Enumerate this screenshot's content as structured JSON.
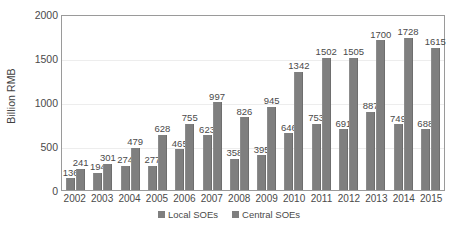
{
  "chart_data": {
    "type": "bar",
    "title": "",
    "subtitle": "",
    "xlabel": "",
    "ylabel": "Billion RMB",
    "ylim": [
      0,
      2000
    ],
    "yticks": [
      0,
      500,
      1000,
      1500,
      2000
    ],
    "grid": true,
    "legend_position": "bottom",
    "categories": [
      "2002",
      "2003",
      "2004",
      "2005",
      "2006",
      "2007",
      "2008",
      "2009",
      "2010",
      "2011",
      "2012",
      "2013",
      "2014",
      "2015"
    ],
    "series": [
      {
        "name": "Local SOEs",
        "color": "#7f7f7f",
        "values": [
          136,
          194,
          274,
          277,
          465,
          623,
          358,
          395,
          646,
          753,
          691,
          887,
          749,
          688
        ]
      },
      {
        "name": "Central SOEs",
        "color": "#7f7f7f",
        "values": [
          241,
          301,
          479,
          628,
          755,
          997,
          826,
          945,
          1342,
          1502,
          1505,
          1700,
          1728,
          1615
        ]
      }
    ],
    "legend": [
      "Local SOEs",
      "Central SOEs"
    ]
  },
  "colors": {
    "bar": "#7f7f7f",
    "gridline": "#ededed",
    "frame": "#9a9a9a",
    "text": "#4a4a4a",
    "background": "#ffffff"
  }
}
